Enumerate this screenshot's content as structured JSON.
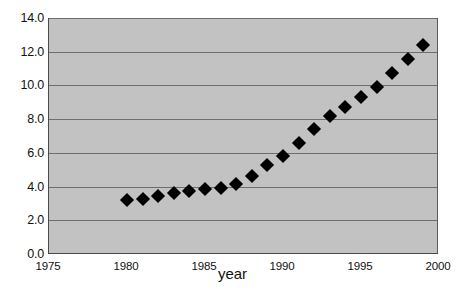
{
  "chart_data": {
    "type": "scatter",
    "title": "",
    "xlabel": "year",
    "ylabel": "",
    "xlim": [
      1975,
      2000
    ],
    "ylim": [
      0.0,
      14.0
    ],
    "grid": true,
    "legend": false,
    "marker": "black-diamond",
    "xticks": [
      "1975",
      "1980",
      "1985",
      "1990",
      "1995",
      "2000"
    ],
    "xtick_values": [
      1975,
      1980,
      1985,
      1990,
      1995,
      2000
    ],
    "yticks": [
      "0.0",
      "2.0",
      "4.0",
      "6.0",
      "8.0",
      "10.0",
      "12.0",
      "14.0"
    ],
    "ytick_values": [
      0.0,
      2.0,
      4.0,
      6.0,
      8.0,
      10.0,
      12.0,
      14.0
    ],
    "x": [
      1980,
      1981,
      1982,
      1983,
      1984,
      1985,
      1986,
      1987,
      1988,
      1989,
      1990,
      1991,
      1992,
      1993,
      1994,
      1995,
      1996,
      1997,
      1998,
      1999
    ],
    "values": [
      3.25,
      3.35,
      3.5,
      3.65,
      3.8,
      3.9,
      4.0,
      4.2,
      4.7,
      5.35,
      5.9,
      6.65,
      7.45,
      8.25,
      8.8,
      9.35,
      9.95,
      10.8,
      11.6,
      12.45
    ],
    "series": [
      {
        "name": "series-1",
        "values": [
          3.25,
          3.35,
          3.5,
          3.65,
          3.8,
          3.9,
          4.0,
          4.2,
          4.7,
          5.35,
          5.9,
          6.65,
          7.45,
          8.25,
          8.8,
          9.35,
          9.95,
          10.8,
          11.6,
          12.45
        ]
      }
    ],
    "colors": {
      "plot_background": "#c2c2c2",
      "gridline": "#6e6e6e",
      "marker": "#000000",
      "axis": "#4a4a4a",
      "text": "#111111",
      "page_background": "#ffffff"
    }
  }
}
